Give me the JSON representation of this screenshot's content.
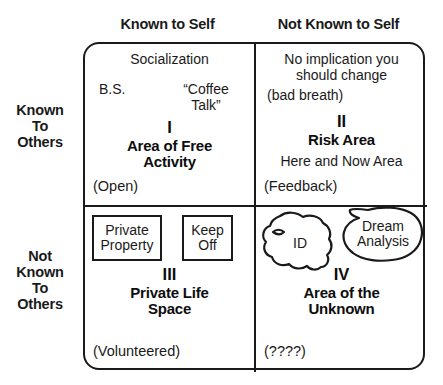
{
  "diagram": {
    "type": "johari-window",
    "column_headers": {
      "left": "Known to Self",
      "right": "Not Known to Self"
    },
    "row_labels": {
      "top": "Known\nTo\nOthers",
      "bottom": "Not\nKnown\nTo\nOthers"
    },
    "quadrants": {
      "q1": {
        "roman": "I",
        "title": "Area of Free\nActivity",
        "top_note": "Socialization",
        "item_left": "B.S.",
        "item_right": "“Coffee\nTalk”",
        "corner_note": "(Open)"
      },
      "q2": {
        "roman": "II",
        "title": "Risk Area",
        "top_note": "No implication you\nshould change",
        "item_left": "(bad breath)",
        "sub_note": "Here and Now Area",
        "corner_note": "(Feedback)"
      },
      "q3": {
        "roman": "III",
        "title": "Private Life\nSpace",
        "sign_one": "Private\nProperty",
        "sign_two": "Keep\nOff",
        "corner_note": "(Volunteered)"
      },
      "q4": {
        "roman": "IV",
        "title": "Area of the\nUnknown",
        "blob_one": "ID",
        "blob_two": "Dream\nAnalysis",
        "corner_note": "(????)"
      }
    },
    "colors": {
      "ink": "#1a1a1a",
      "background": "#ffffff"
    }
  }
}
